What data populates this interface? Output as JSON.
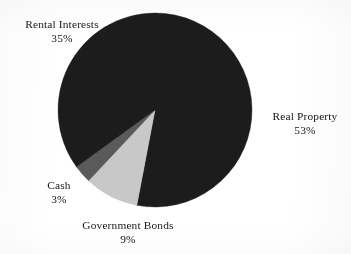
{
  "figure": {
    "background_color": "#ffffff",
    "text_color": "#161616"
  },
  "chart_data": {
    "type": "pie",
    "title": "",
    "subtitle": "",
    "xlabel": "",
    "ylabel": "",
    "legend_position": "none",
    "grid": false,
    "label_format": "name above percentage",
    "start_angle_deg": 0,
    "direction": "clockwise",
    "center": {
      "x": 155,
      "y": 110
    },
    "radius": 97,
    "categories": [
      "Real Property",
      "Government Bonds",
      "Cash",
      "Rental Interests"
    ],
    "values": [
      53,
      9,
      3,
      35
    ],
    "value_labels": [
      "53%",
      "9%",
      "3%",
      "35%"
    ],
    "colors": [
      "#1c1c1c",
      "#c8c8c8",
      "#5a5a5a",
      "#1c1c1c"
    ],
    "total": 100,
    "slices": [
      {
        "name": "Real Property",
        "value": 53,
        "value_label": "53%",
        "color": "#1c1c1c",
        "start_angle_deg": 0,
        "end_angle_deg": 190.8
      },
      {
        "name": "Government Bonds",
        "value": 9,
        "value_label": "9%",
        "color": "#c8c8c8",
        "start_angle_deg": 190.8,
        "end_angle_deg": 223.2
      },
      {
        "name": "Cash",
        "value": 3,
        "value_label": "3%",
        "color": "#5a5a5a",
        "start_angle_deg": 223.2,
        "end_angle_deg": 234.0
      },
      {
        "name": "Rental Interests",
        "value": 35,
        "value_label": "35%",
        "color": "#1c1c1c",
        "start_angle_deg": 234.0,
        "end_angle_deg": 360.0
      }
    ]
  },
  "labels": {
    "rental_interests": {
      "name": "Rental Interests",
      "value": "35%"
    },
    "real_property": {
      "name": "Real Property",
      "value": "53%"
    },
    "cash": {
      "name": "Cash",
      "value": "3%"
    },
    "government_bonds": {
      "name": "Government Bonds",
      "value": "9%"
    }
  }
}
